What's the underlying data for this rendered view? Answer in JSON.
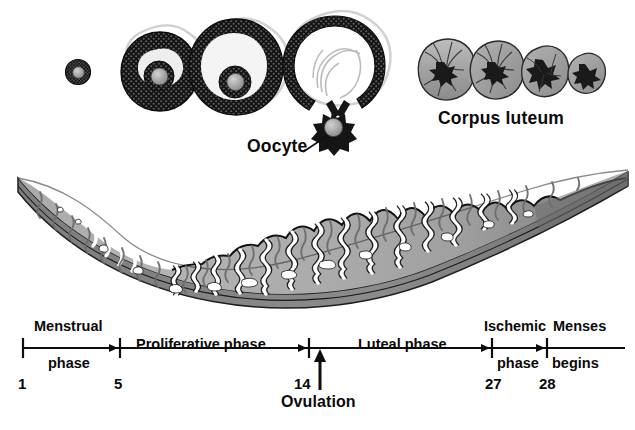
{
  "figure": {
    "title_visible": false,
    "domain_note": "ovarian-cycle-and-endometrial-cycle-diagram"
  },
  "labels": {
    "corpus_luteum": "Corpus luteum",
    "oocyte": "Oocyte",
    "ovulation": "Ovulation"
  },
  "timeline": {
    "phases": [
      {
        "name": "menstrual",
        "line1": "Menstrual",
        "line2": "phase"
      },
      {
        "name": "proliferative",
        "line1": "Proliferative phase",
        "line2": ""
      },
      {
        "name": "luteal",
        "line1": "Luteal phase",
        "line2": ""
      },
      {
        "name": "ischemic",
        "line1": "Ischemic",
        "line2": "phase"
      },
      {
        "name": "menses",
        "line1": "Menses",
        "line2": "begins"
      }
    ],
    "day_ticks": [
      "1",
      "5",
      "14",
      "27",
      "28"
    ]
  },
  "ovarian_structures": {
    "follicles": [
      {
        "name": "primordial-follicle",
        "stage": 1
      },
      {
        "name": "primary-follicle",
        "stage": 2
      },
      {
        "name": "secondary-follicle",
        "stage": 3
      },
      {
        "name": "mature-graafian-follicle-rupturing",
        "stage": 4
      }
    ],
    "corpus_luteum_stages": [
      {
        "name": "corpus-luteum-early",
        "stage": 1
      },
      {
        "name": "corpus-luteum-mature",
        "stage": 2
      },
      {
        "name": "corpus-luteum-regressing",
        "stage": 3
      },
      {
        "name": "corpus-albicans",
        "stage": 4
      }
    ],
    "released_oocyte": {
      "name": "oocyte"
    }
  },
  "endometrium": {
    "layers": [
      {
        "name": "functional-layer"
      },
      {
        "name": "basal-layer"
      },
      {
        "name": "myometrium-border"
      }
    ],
    "features": [
      "uterine-glands",
      "spiral-arteries",
      "venous-lakes"
    ]
  },
  "colors": {
    "ink": "#0a0a0a",
    "follicle_dark": "#181818",
    "follicle_outline": "#d9d9d9",
    "oocyte_core": "#9a9a9a",
    "luteum_fill": "#a8a8a8",
    "luteum_fill_dark": "#8e8e8e",
    "endo_light": "#b5b5b5",
    "endo_mid": "#9e9e9e",
    "endo_dark": "#7d7d7d",
    "gland_white": "#ffffff",
    "background": "#ffffff"
  }
}
